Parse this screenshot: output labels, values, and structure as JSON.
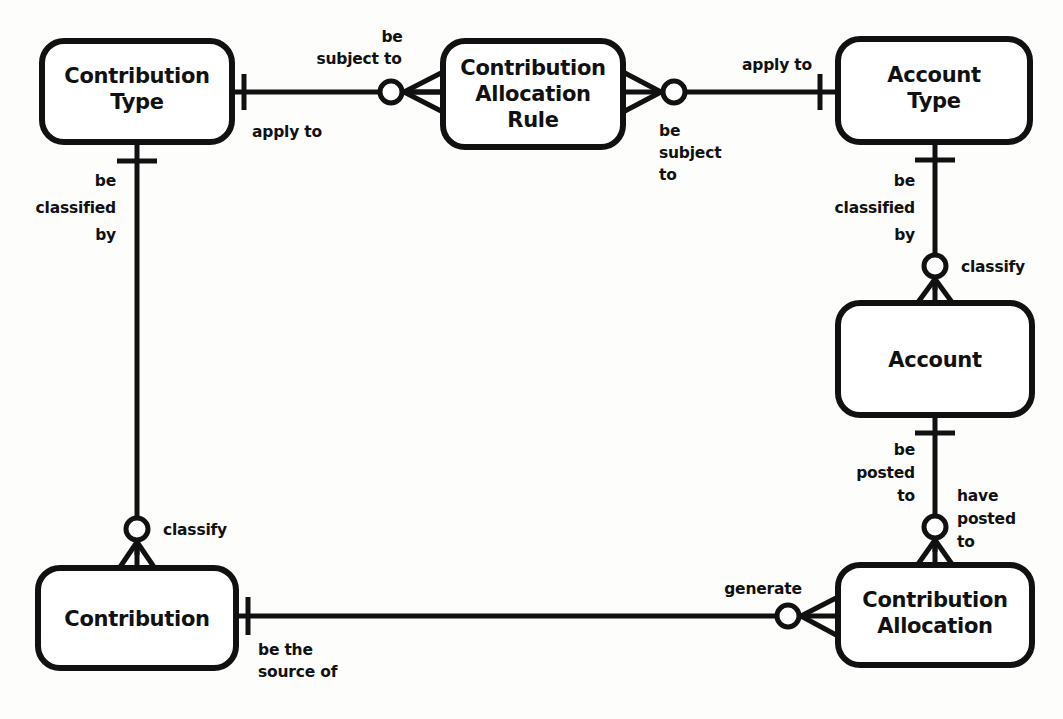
{
  "diagram": {
    "type": "entity-relationship-diagram",
    "notation": "crows-foot",
    "background_color": "#fdfdfc",
    "line_color": "#111111",
    "box_fill_color": "#ffffff",
    "entities": [
      {
        "id": "contribution-type",
        "name": "Contribution Type",
        "lines": [
          "Contribution",
          "Type"
        ],
        "x": 42,
        "y": 41,
        "w": 190,
        "h": 101
      },
      {
        "id": "contribution-allocation-rule",
        "name": "Contribution Allocation Rule",
        "lines": [
          "Contribution",
          "Allocation",
          "Rule"
        ],
        "x": 443,
        "y": 41,
        "w": 180,
        "h": 106
      },
      {
        "id": "account-type",
        "name": "Account Type",
        "lines": [
          "Account",
          "Type"
        ],
        "x": 838,
        "y": 39,
        "w": 192,
        "h": 103
      },
      {
        "id": "account",
        "name": "Account",
        "lines": [
          "Account"
        ],
        "x": 838,
        "y": 303,
        "w": 194,
        "h": 112
      },
      {
        "id": "contribution",
        "name": "Contribution",
        "lines": [
          "Contribution"
        ],
        "x": 38,
        "y": 568,
        "w": 198,
        "h": 100
      },
      {
        "id": "contribution-allocation",
        "name": "Contribution Allocation",
        "lines": [
          "Contribution",
          "Allocation"
        ],
        "x": 838,
        "y": 565,
        "w": 194,
        "h": 100
      }
    ],
    "relationships": [
      {
        "id": "ctype-rule",
        "from": "contribution-type",
        "to": "contribution-allocation-rule",
        "from_label": "apply to",
        "to_label": "be subject to",
        "from_cardinality": "one-mandatory",
        "to_cardinality": "many-optional"
      },
      {
        "id": "rule-atype",
        "from": "contribution-allocation-rule",
        "to": "account-type",
        "from_label": "be subject to",
        "to_label": "apply to",
        "from_cardinality": "many-optional",
        "to_cardinality": "one-mandatory"
      },
      {
        "id": "atype-account",
        "from": "account-type",
        "to": "account",
        "from_label": "be classified by",
        "to_label": "classify",
        "from_cardinality": "one-mandatory",
        "to_cardinality": "many-optional"
      },
      {
        "id": "account-calloc",
        "from": "account",
        "to": "contribution-allocation",
        "from_label": "be posted to",
        "to_label": "have posted to",
        "from_cardinality": "one-mandatory",
        "to_cardinality": "many-optional"
      },
      {
        "id": "ctype-contribution",
        "from": "contribution-type",
        "to": "contribution",
        "from_label": "be classified by",
        "to_label": "classify",
        "from_cardinality": "one-mandatory",
        "to_cardinality": "many-optional"
      },
      {
        "id": "contribution-calloc",
        "from": "contribution",
        "to": "contribution-allocation",
        "from_label": "be the source of",
        "to_label": "generate",
        "from_cardinality": "one-mandatory",
        "to_cardinality": "many-optional"
      }
    ],
    "labels": {
      "apply_to_1": "apply to",
      "be_subject_to_1_l1": "be",
      "be_subject_to_1_l2": "subject to",
      "be_subject_to_2_l1": "be",
      "be_subject_to_2_l2": "subject",
      "be_subject_to_2_l3": "to",
      "apply_to_2": "apply to",
      "be_classified_by_left_l1": "be",
      "be_classified_by_left_l2": "classified",
      "be_classified_by_left_l3": "by",
      "classify_left": "classify",
      "be_classified_by_right_l1": "be",
      "be_classified_by_right_l2": "classified",
      "be_classified_by_right_l3": "by",
      "classify_right": "classify",
      "be_posted_to_l1": "be",
      "be_posted_to_l2": "posted",
      "be_posted_to_l3": "to",
      "have_posted_to_l1": "have",
      "have_posted_to_l2": "posted",
      "have_posted_to_l3": "to",
      "be_the_source_of_l1": "be the",
      "be_the_source_of_l2": "source of",
      "generate": "generate"
    },
    "entity_text": {
      "contribution_type_l1": "Contribution",
      "contribution_type_l2": "Type",
      "rule_l1": "Contribution",
      "rule_l2": "Allocation",
      "rule_l3": "Rule",
      "account_type_l1": "Account",
      "account_type_l2": "Type",
      "account_l1": "Account",
      "contribution_l1": "Contribution",
      "contribution_allocation_l1": "Contribution",
      "contribution_allocation_l2": "Allocation"
    }
  }
}
